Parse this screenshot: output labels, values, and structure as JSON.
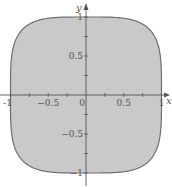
{
  "figure": {
    "type": "region-plot",
    "region": {
      "equation": "x^4 + y^4 <= 1",
      "exponent": 4,
      "fill_color": "#c9c9c9",
      "stroke_color": "#6e6e6e"
    },
    "axes": {
      "x_label": "x",
      "y_label": "y",
      "xlim": [
        -1.1,
        1.1
      ],
      "ylim": [
        -1.1,
        1.1
      ],
      "x_ticks": [
        -1,
        -0.75,
        -0.5,
        -0.25,
        0,
        0.25,
        0.5,
        0.75,
        1
      ],
      "y_ticks": [
        -1,
        -0.75,
        -0.5,
        -0.25,
        0.25,
        0.5,
        0.75,
        1
      ],
      "x_tick_labels": [
        {
          "value": -1,
          "text": "-1"
        },
        {
          "value": -0.5,
          "text": "−0.5"
        },
        {
          "value": 0,
          "text": "0"
        },
        {
          "value": 0.5,
          "text": "0.5"
        },
        {
          "value": 1,
          "text": "1"
        }
      ],
      "y_tick_labels": [
        {
          "value": 1,
          "text": "1"
        },
        {
          "value": 0.5,
          "text": "0.5"
        },
        {
          "value": -0.5,
          "text": "−0.5"
        },
        {
          "value": -1,
          "text": "−1"
        }
      ],
      "axis_color": "#555555",
      "label_color": "#555555"
    }
  }
}
